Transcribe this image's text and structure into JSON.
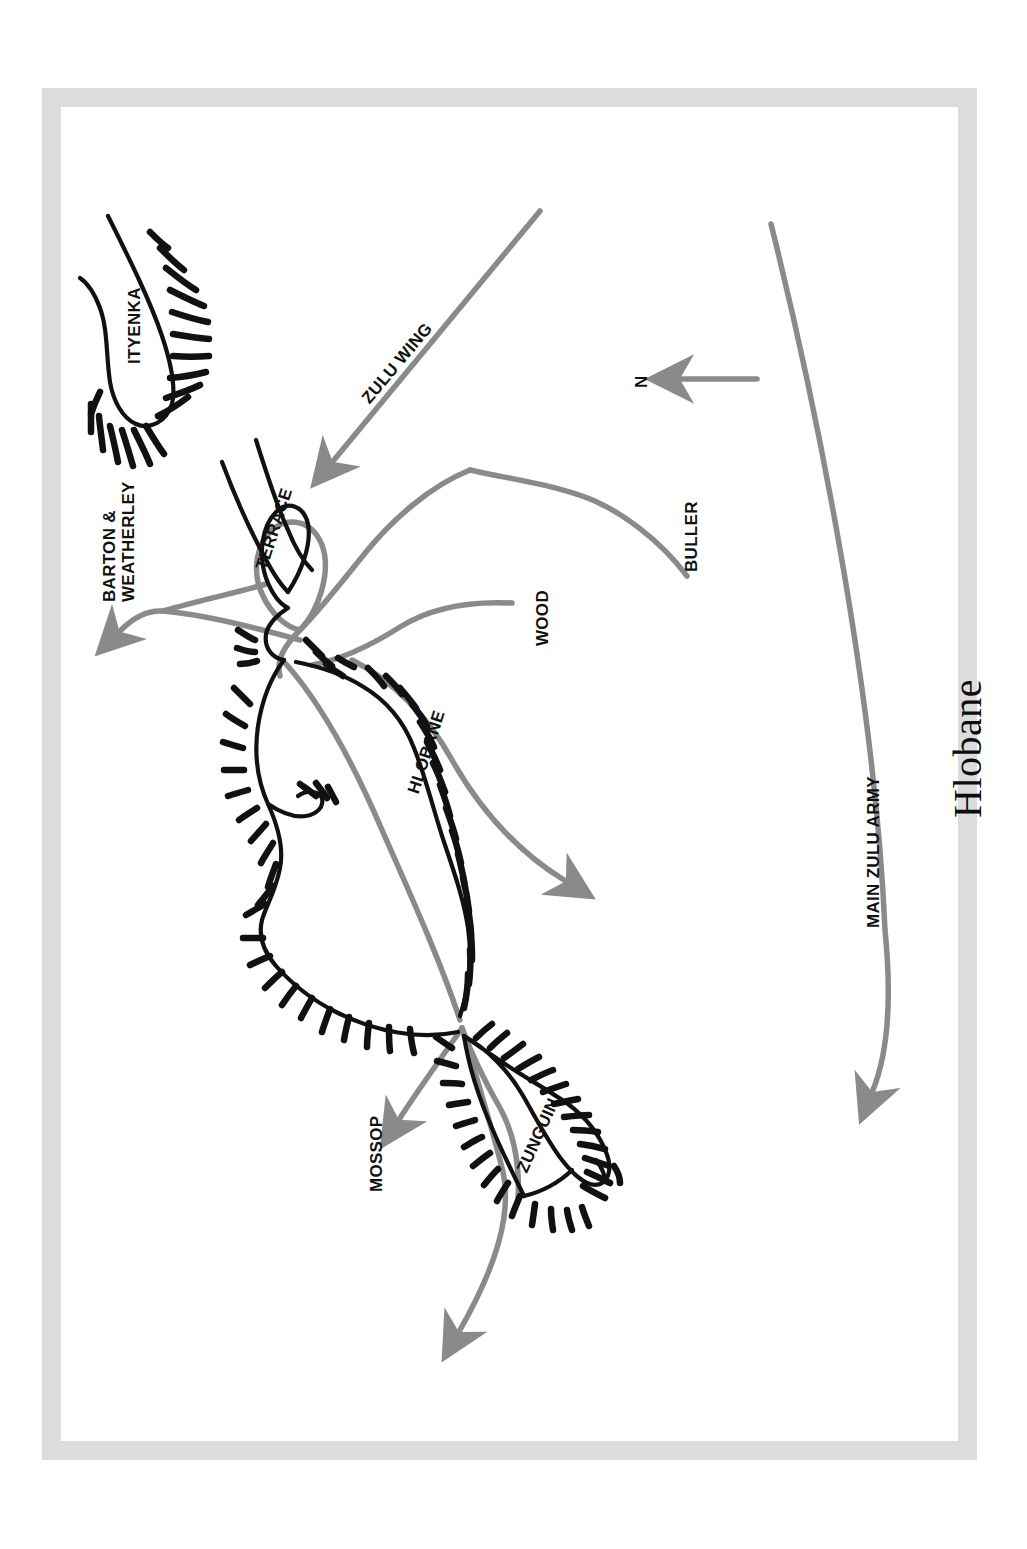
{
  "page": {
    "background_color": "#ffffff",
    "frame_color": "#dcdcdc"
  },
  "title": "Hlobane",
  "colors": {
    "terrain_outline": "#000000",
    "hachure": "#000000",
    "route": "#808080",
    "frame": "#dcdcdc",
    "text": "#111111"
  },
  "compass": {
    "label": "N",
    "direction": "arrow pointing left (north is to the left of the page)"
  },
  "labels": {
    "ityenka": "ITYENKA",
    "terrace": "TERRACE",
    "hlobane": "HLOBANE",
    "zunguin": "ZUNGUIN",
    "wood": "WOOD",
    "buller": "BULLER",
    "zulu_wing": "ZULU WING",
    "main_zulu_army": "MAIN ZULU ARMY",
    "barton_weatherley_line1": "BARTON &",
    "barton_weatherley_line2": "WEATHERLEY",
    "mossop": "MOSSOP"
  },
  "map_features": {
    "plateaus": [
      {
        "name": "ITYENKA",
        "kind": "hachured-plateau"
      },
      {
        "name": "HLOBANE",
        "kind": "hachured-plateau"
      },
      {
        "name": "ZUNGUIN",
        "kind": "hachured-plateau"
      },
      {
        "name": "TERRACE",
        "kind": "terrace-ridge"
      }
    ],
    "movement_arrows": [
      {
        "name": "ZULU WING",
        "color": "#808080",
        "has_arrowhead": true
      },
      {
        "name": "MAIN ZULU ARMY",
        "color": "#808080",
        "has_arrowhead": true
      },
      {
        "name": "BARTON & WEATHERLEY",
        "color": "#808080",
        "has_arrowhead": true
      },
      {
        "name": "MOSSOP",
        "color": "#808080",
        "has_arrowhead": true
      },
      {
        "name": "BULLER",
        "color": "#808080",
        "has_arrowhead": false
      },
      {
        "name": "WOOD",
        "color": "#808080",
        "has_arrowhead": false
      },
      {
        "name": "retreat-south-east",
        "color": "#808080",
        "has_arrowhead": true
      },
      {
        "name": "retreat-south-west",
        "color": "#808080",
        "has_arrowhead": true
      }
    ]
  }
}
